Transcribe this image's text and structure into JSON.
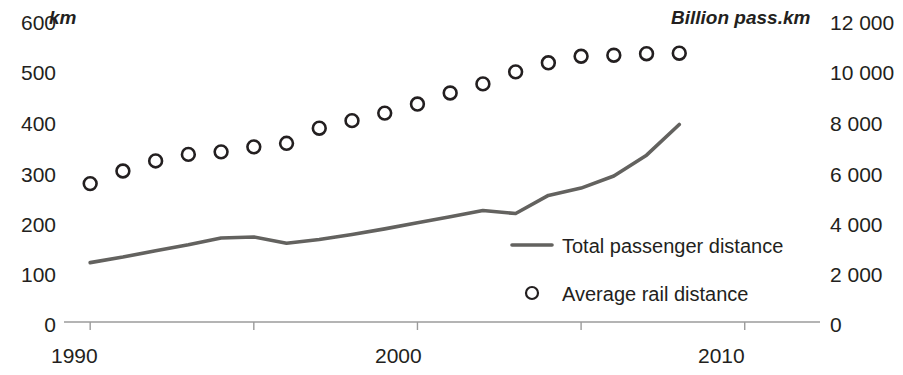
{
  "chart_data": {
    "type": "line",
    "title": "",
    "xlabel": "",
    "left_axis": {
      "unit_label": "km",
      "ticks": [
        "0",
        "100",
        "200",
        "300",
        "400",
        "500",
        "600"
      ],
      "min": 0,
      "max": 600
    },
    "right_axis": {
      "unit_label": "Billion pass.km",
      "ticks": [
        "0",
        "2 000",
        "4 000",
        "6 000",
        "8 000",
        "10 000",
        "12 000"
      ],
      "min": 0,
      "max": 12000
    },
    "x": [
      1990,
      1991,
      1992,
      1993,
      1994,
      1995,
      1996,
      1997,
      1998,
      1999,
      2000,
      2001,
      2002,
      2003,
      2004,
      2005,
      2006,
      2007,
      2008
    ],
    "xticks": [
      "1990",
      "2000",
      "2010"
    ],
    "xtick_values": [
      1990,
      2000,
      2010
    ],
    "xlim": [
      1989.2,
      2012.3
    ],
    "grid": false,
    "legend_position": "inside-right-lower",
    "series": [
      {
        "name": "Total passenger distance",
        "axis": "right",
        "unit": "Billion pass.km",
        "style": "line",
        "color": "#63625f",
        "values": [
          2360,
          2580,
          2830,
          3070,
          3340,
          3380,
          3130,
          3280,
          3480,
          3700,
          3940,
          4180,
          4430,
          4310,
          5030,
          5320,
          5800,
          6630,
          7850
        ]
      },
      {
        "name": "Average rail distance",
        "axis": "left",
        "unit": "km",
        "style": "markers",
        "marker": "open-circle",
        "color": "#231f20",
        "values": [
          275,
          300,
          320,
          333,
          338,
          348,
          355,
          385,
          400,
          415,
          433,
          455,
          473,
          497,
          515,
          528,
          530,
          533,
          534
        ]
      }
    ]
  }
}
